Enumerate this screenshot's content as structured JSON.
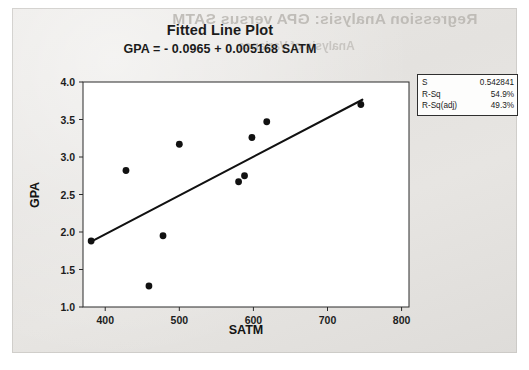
{
  "page": {
    "ghost_text_heading": "Regression Analysis: GPA versus SATM",
    "ghost_text_sub": "Analysis of Variance"
  },
  "chart_data": {
    "type": "scatter",
    "title": "Fitted Line Plot",
    "subtitle": "GPA = - 0.0965 + 0.005168 SATM",
    "xlabel": "SATM",
    "ylabel": "GPA",
    "xlim": [
      370,
      810
    ],
    "ylim": [
      1.0,
      4.0
    ],
    "xticks": [
      400,
      500,
      600,
      700,
      800
    ],
    "xtick_labels": [
      "400",
      "500",
      "600",
      "700",
      "800"
    ],
    "yticks": [
      1.0,
      1.5,
      2.0,
      2.5,
      3.0,
      3.5,
      4.0
    ],
    "ytick_labels": [
      "1.0",
      "1.5",
      "2.0",
      "2.5",
      "3.0",
      "3.5",
      "4.0"
    ],
    "grid": false,
    "legend": "none",
    "marker_color": "#111111",
    "line_color": "#111111",
    "points": [
      {
        "x": 381,
        "y": 1.88
      },
      {
        "x": 428,
        "y": 2.82
      },
      {
        "x": 459,
        "y": 1.28
      },
      {
        "x": 478,
        "y": 1.95
      },
      {
        "x": 500,
        "y": 3.17
      },
      {
        "x": 580,
        "y": 2.67
      },
      {
        "x": 588,
        "y": 2.75
      },
      {
        "x": 598,
        "y": 3.26
      },
      {
        "x": 618,
        "y": 3.47
      },
      {
        "x": 745,
        "y": 3.7
      }
    ],
    "fit_line": {
      "intercept": -0.0965,
      "slope": 0.005168,
      "x_start": 381,
      "x_end": 747
    },
    "annotations": {
      "stats": [
        {
          "label": "S",
          "value": "0.542841"
        },
        {
          "label": "R-Sq",
          "value": "54.9%"
        },
        {
          "label": "R-Sq(adj)",
          "value": "49.3%"
        }
      ]
    }
  }
}
